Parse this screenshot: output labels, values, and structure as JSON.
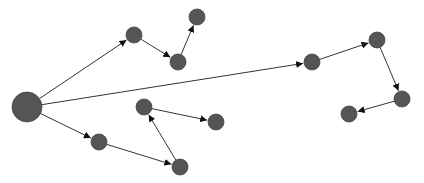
{
  "diagram": {
    "type": "directed-graph",
    "background": "#ffffff",
    "node_color": "#555555",
    "edge_color": "#333333",
    "nodes": [
      {
        "id": "n0",
        "x": 27,
        "y": 107,
        "r": 15
      },
      {
        "id": "n1",
        "x": 134,
        "y": 35,
        "r": 8
      },
      {
        "id": "n2",
        "x": 178,
        "y": 62,
        "r": 8
      },
      {
        "id": "n3",
        "x": 197,
        "y": 17,
        "r": 8
      },
      {
        "id": "n4",
        "x": 312,
        "y": 62,
        "r": 8
      },
      {
        "id": "n5",
        "x": 377,
        "y": 40,
        "r": 8
      },
      {
        "id": "n6",
        "x": 402,
        "y": 99,
        "r": 8
      },
      {
        "id": "n7",
        "x": 349,
        "y": 114,
        "r": 8
      },
      {
        "id": "n8",
        "x": 99,
        "y": 142,
        "r": 8
      },
      {
        "id": "n9",
        "x": 180,
        "y": 167,
        "r": 8
      },
      {
        "id": "n10",
        "x": 144,
        "y": 107,
        "r": 8
      },
      {
        "id": "n11",
        "x": 216,
        "y": 122,
        "r": 8
      }
    ],
    "edges": [
      {
        "from": "n0",
        "to": "n1"
      },
      {
        "from": "n1",
        "to": "n2"
      },
      {
        "from": "n2",
        "to": "n3"
      },
      {
        "from": "n0",
        "to": "n4"
      },
      {
        "from": "n4",
        "to": "n5"
      },
      {
        "from": "n5",
        "to": "n6"
      },
      {
        "from": "n6",
        "to": "n7"
      },
      {
        "from": "n0",
        "to": "n8"
      },
      {
        "from": "n8",
        "to": "n9"
      },
      {
        "from": "n9",
        "to": "n10"
      },
      {
        "from": "n10",
        "to": "n11"
      }
    ]
  }
}
